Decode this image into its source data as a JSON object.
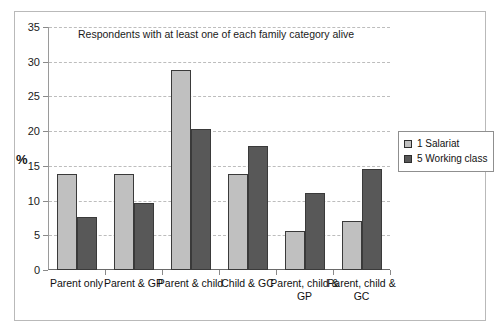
{
  "chart_data": {
    "type": "bar",
    "title": "Respondents with at least one of each family category alive",
    "xlabel": "",
    "ylabel": "%",
    "ylim": [
      0,
      35
    ],
    "ytick_step": 5,
    "yticks": [
      0,
      5,
      10,
      15,
      20,
      25,
      30,
      35
    ],
    "grid": "horizontal-dashed",
    "legend_position": "right",
    "categories": [
      "Parent only",
      "Parent & GP",
      "Parent & child",
      "Child & GC",
      "Parent, child & GP",
      "Parent, child & GC"
    ],
    "series": [
      {
        "name": "1 Salariat",
        "color": "#c0c0c0",
        "values": [
          13.8,
          13.8,
          28.8,
          13.8,
          5.6,
          7.0
        ]
      },
      {
        "name": "5 Working class",
        "color": "#585858",
        "values": [
          7.7,
          9.6,
          20.3,
          17.9,
          11.1,
          14.6
        ]
      }
    ]
  },
  "legend": {
    "items": [
      {
        "label": "1 Salariat",
        "color": "#c0c0c0"
      },
      {
        "label": "5 Working class",
        "color": "#585858"
      }
    ]
  }
}
